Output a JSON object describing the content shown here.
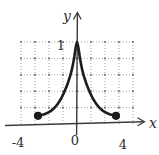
{
  "figure": {
    "background": "#ffffff",
    "ink_color": "#1c1c1c",
    "axis_color": "#3c3c3c",
    "grid_color": "#9b9b9b",
    "grid_dot_color": "#757575",
    "label_color": "#2e2e2e"
  },
  "labels": {
    "y_axis": "y",
    "x_axis": "x",
    "y_tick_1": "1",
    "origin": "0",
    "x_tick_neg4": "-4",
    "x_tick_pos4": "4"
  },
  "chart_data": {
    "type": "line",
    "title": "",
    "xlabel": "x",
    "ylabel": "y",
    "xlim": [
      -4,
      4
    ],
    "ylim": [
      0,
      1
    ],
    "x_ticks_labeled": [
      -4,
      0,
      4
    ],
    "y_ticks_labeled": [
      1
    ],
    "grid": true,
    "grid_style": "dotted",
    "grid_columns": 8,
    "grid_rows": 5,
    "series": [
      {
        "name": "curve",
        "description": "bell-shaped spike, resembles y = 1/(1+x^2) on [-3,3]",
        "x": [
          -3,
          -2.5,
          -2,
          -1.5,
          -1,
          -0.5,
          -0.25,
          0,
          0.25,
          0.5,
          1,
          1.5,
          2,
          2.5,
          3
        ],
        "y": [
          0.1,
          0.12,
          0.16,
          0.24,
          0.38,
          0.6,
          0.78,
          1.0,
          0.78,
          0.6,
          0.38,
          0.24,
          0.16,
          0.12,
          0.1
        ]
      }
    ],
    "endpoints": [
      {
        "x": -3,
        "y": 0.1,
        "marker": "filled-dot"
      },
      {
        "x": 3,
        "y": 0.1,
        "marker": "filled-dot"
      }
    ],
    "peak": {
      "x": 0,
      "y": 1.0
    }
  }
}
